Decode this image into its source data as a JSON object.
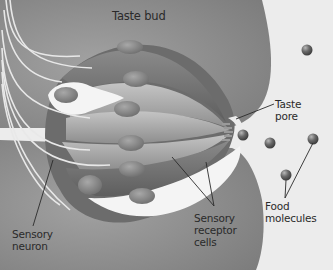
{
  "diagram": {
    "labels": {
      "taste_bud": "Taste bud",
      "taste_pore_line1": "Taste",
      "taste_pore_line2": "pore",
      "sensory_neuron_line1": "Sensory",
      "sensory_neuron_line2": "neuron",
      "receptor_line1": "Sensory",
      "receptor_line2": "receptor",
      "receptor_line3": "cells",
      "food_line1": "Food",
      "food_line2": "molecules"
    },
    "colors": {
      "background": "#ececec",
      "tissue": "#8f8f8f",
      "tissue_dark": "#6e6e6e",
      "cell_light": "#b4b4b4",
      "cell_mid": "#9a9a9a",
      "support_cell": "#f4f4f4",
      "nucleus": "#8a8a8a",
      "neuron_fiber": "#e8e8e8",
      "molecule": "#6a6a6a",
      "leader_line": "#2a2a2a"
    },
    "food_molecules": [
      {
        "x": 307,
        "y": 50
      },
      {
        "x": 270,
        "y": 137
      },
      {
        "x": 243,
        "y": 135
      },
      {
        "x": 313,
        "y": 139
      },
      {
        "x": 286,
        "y": 174
      }
    ]
  }
}
